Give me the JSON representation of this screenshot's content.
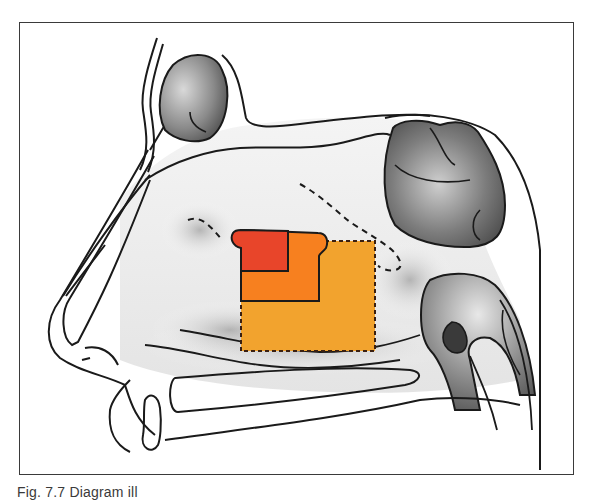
{
  "figure": {
    "caption": "Fig. 7.7 Diagram ill",
    "caption_visibility": "clipped at bottom edge"
  },
  "diagram": {
    "type": "sagittal section of nasal cavity and paranasal sinuses",
    "structures": [
      {
        "name": "frontal-sinus",
        "shading": "gray gradient"
      },
      {
        "name": "sphenoid-sinus",
        "shading": "gray gradient"
      },
      {
        "name": "nasopharynx-eustachian-opening",
        "shading": "gray gradient"
      },
      {
        "name": "nasal-dorsum",
        "shading": "outline"
      },
      {
        "name": "hard-palate",
        "shading": "outline"
      },
      {
        "name": "turbinates",
        "shading": "gray gradient"
      }
    ],
    "regions": [
      {
        "name": "region-small",
        "color": "#e8452a",
        "border": "solid"
      },
      {
        "name": "region-medium",
        "color": "#f7801f",
        "border": "solid"
      },
      {
        "name": "region-large",
        "color": "#f2a32e",
        "border": "dashed"
      }
    ],
    "colors": {
      "outline": "#1a1a1a",
      "frame": "#3a3a3a",
      "shade_dark": "#5a5a5a",
      "shade_light": "#e6e6e6"
    }
  }
}
